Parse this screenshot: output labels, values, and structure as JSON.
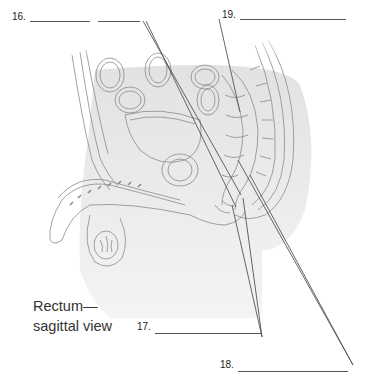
{
  "figure": {
    "caption_line1": "Rectum—",
    "caption_line2": "sagittal view",
    "labels": [
      {
        "number": "16.",
        "answer": ""
      },
      {
        "number": "17.",
        "answer": ""
      },
      {
        "number": "18.",
        "answer": ""
      },
      {
        "number": "19.",
        "answer": ""
      }
    ]
  },
  "colors": {
    "line": "#555555",
    "shadow": "#e4e4e4",
    "drawing": "#8a8a8a"
  }
}
